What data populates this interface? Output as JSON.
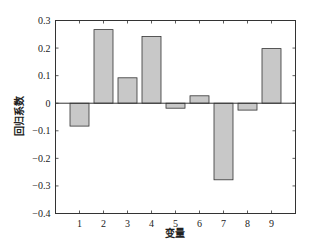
{
  "chart_data": {
    "type": "bar",
    "title": "",
    "xlabel": "变量",
    "ylabel": "回归系数",
    "categories": [
      "1",
      "2",
      "3",
      "4",
      "5",
      "6",
      "7",
      "8",
      "9"
    ],
    "values": [
      -0.083,
      0.267,
      0.092,
      0.242,
      -0.018,
      0.027,
      -0.278,
      -0.025,
      0.198
    ],
    "xlim": [
      0,
      10
    ],
    "ylim": [
      -0.4,
      0.3
    ],
    "yticks": [
      0.3,
      0.2,
      0.1,
      0,
      -0.1,
      -0.2,
      -0.3,
      -0.4
    ],
    "ytick_labels": [
      "0.3",
      "0.2",
      "0.1",
      "0",
      "−0.1",
      "−0.2",
      "−0.3",
      "−0.4"
    ],
    "xticks": [
      1,
      2,
      3,
      4,
      5,
      6,
      7,
      8,
      9
    ],
    "grid": false,
    "legend": null,
    "bar_color": "#c8c8c8",
    "edge_color": "#333333",
    "baseline": 0
  }
}
